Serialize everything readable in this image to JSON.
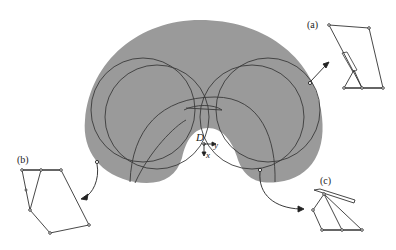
{
  "figure": {
    "labels": {
      "a": "(a)",
      "b": "(b)",
      "c": "(c)",
      "origin": "D",
      "x_axis": "x",
      "y_axis": "y"
    },
    "colors": {
      "workspace_fill": "#9a9a9a",
      "line": "#333333",
      "background": "#ffffff"
    },
    "insets": [
      {
        "id": "a",
        "description": "mechanism configuration at right boundary point"
      },
      {
        "id": "b",
        "description": "mechanism configuration at lower-left boundary point"
      },
      {
        "id": "c",
        "description": "mechanism configuration at lower-right boundary point"
      }
    ]
  }
}
